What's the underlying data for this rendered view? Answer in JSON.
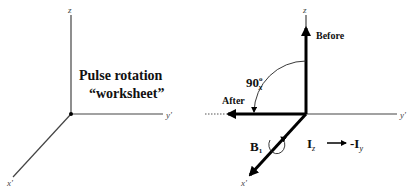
{
  "left_diagram": {
    "axes": {
      "z": "z",
      "y": "y'",
      "x": "x'"
    },
    "title_line1": "Pulse rotation",
    "title_line2": "“worksheet”"
  },
  "right_diagram": {
    "axes": {
      "z": "z",
      "y": "y'",
      "x": "x'"
    },
    "before_label": "Before",
    "after_label": "After",
    "angle_label": "90",
    "angle_degree": "o",
    "angle_subscript": "x",
    "field_label": "B",
    "field_subscript": "1",
    "transition": {
      "from": "I",
      "from_sub": "z",
      "arrow": "→",
      "to": "-I",
      "to_sub": "y"
    }
  },
  "colors": {
    "axis": "#333333",
    "vector": "#000000",
    "text": "#111111",
    "background": "#ffffff"
  }
}
